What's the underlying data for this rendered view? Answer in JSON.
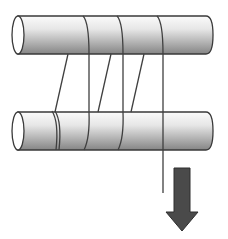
{
  "diagram": {
    "kind": "pulley-rope-wrap",
    "colors": {
      "stroke": "#3a3a3a",
      "cylinder_light": "#f2f2f2",
      "cylinder_dark": "#8a8a8a",
      "arrow_fill": "#4a4a4a",
      "background": "#ffffff"
    },
    "cylinders": [
      {
        "name": "top-cylinder",
        "x0": 18,
        "x1": 212,
        "y_top": 16,
        "y_bottom": 54
      },
      {
        "name": "bottom-cylinder",
        "x0": 18,
        "x1": 212,
        "y_top": 112,
        "y_bottom": 150
      }
    ],
    "rope": {
      "diagonals": [
        {
          "from": [
            68,
            54
          ],
          "to": [
            55,
            112
          ]
        },
        {
          "from": [
            111,
            54
          ],
          "to": [
            98,
            112
          ]
        },
        {
          "from": [
            144,
            54
          ],
          "to": [
            131,
            112
          ]
        }
      ],
      "verticals_x": [
        89,
        123,
        163
      ],
      "free_end": {
        "x": 163,
        "y_end": 193
      }
    },
    "arrow": {
      "direction": "down",
      "label": ""
    }
  }
}
